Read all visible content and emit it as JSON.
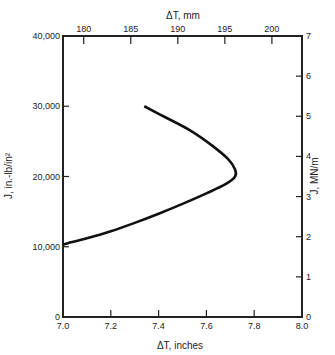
{
  "chart_data": {
    "type": "line",
    "title": "",
    "xlabel": "ΔT, inches",
    "ylabel": "J, in.-lb/in²",
    "x2label": "ΔT, mm",
    "y2label": "J, MN/m",
    "xlim": [
      7.0,
      8.0
    ],
    "ylim": [
      0,
      40000
    ],
    "x2lim_mm": [
      177.8,
      203.2
    ],
    "y2lim": [
      0,
      7
    ],
    "grid": false,
    "x_ticks": [
      "7.0",
      "7.2",
      "7.4",
      "7.6",
      "7.8",
      "8.0"
    ],
    "y_ticks": [
      "0",
      "10,000",
      "20,000",
      "30,000",
      "40,000"
    ],
    "x2_ticks": [
      "180",
      "185",
      "190",
      "195",
      "200"
    ],
    "y2_ticks": [
      "0",
      "1",
      "2",
      "3",
      "4",
      "5",
      "6",
      "7"
    ],
    "series": [
      {
        "name": "J vs ΔT",
        "x": [
          7.0,
          7.02,
          7.1,
          7.2,
          7.3,
          7.4,
          7.5,
          7.6,
          7.68,
          7.72,
          7.72,
          7.69,
          7.62,
          7.53,
          7.43,
          7.34
        ],
        "y": [
          10300,
          10500,
          11200,
          12200,
          13400,
          14700,
          16100,
          17600,
          18900,
          20000,
          21000,
          22500,
          24500,
          26600,
          28400,
          30000
        ]
      }
    ]
  }
}
